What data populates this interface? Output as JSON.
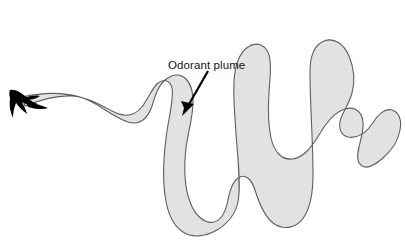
{
  "figure": {
    "type": "scientific-illustration",
    "background_color": "#ffffff",
    "width": 405,
    "height": 250
  },
  "annotations": [
    {
      "id": "odorant-plume-label",
      "text": "Odorant plume",
      "text_x": 168,
      "text_y": 69,
      "font_size": 11.5,
      "color": "#141414",
      "pointer": {
        "from_x": 208,
        "from_y": 71,
        "to_x": 184,
        "to_y": 113,
        "color": "#000000"
      }
    }
  ],
  "shapes": {
    "plume": {
      "name": "odorant-plume",
      "fill_color": "#e2e2e2",
      "stroke_color": "#5e5e5e",
      "stroke_width": 1.1,
      "description": "Meandering ribbon-shaped odor plume extending from the moth at left, snaking right and downward through a large loop."
    },
    "moth": {
      "name": "moth-silhouette",
      "fill_color": "#000000",
      "position_x": 18,
      "position_y": 100,
      "description": "Black silhouette of a moth in flight at the narrow upwind tip of the plume."
    }
  },
  "colors": {
    "plume_fill": "#e2e2e2",
    "plume_stroke": "#5e5e5e",
    "moth": "#000000",
    "arrow": "#000000",
    "text": "#141414",
    "background": "#ffffff"
  }
}
